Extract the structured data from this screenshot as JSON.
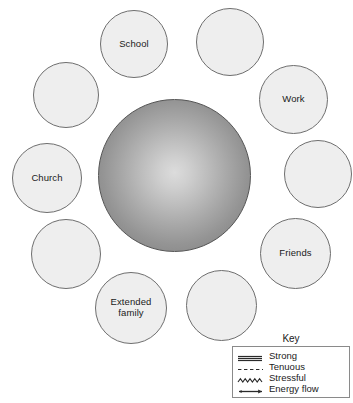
{
  "diagram": {
    "type": "ecomap",
    "center": {
      "name": "central-sphere",
      "label": "",
      "fill_center": "#dcdcdc",
      "fill_edge": "#7e7e7e",
      "border": "#555555"
    },
    "node_fill": "#eeeeee",
    "node_border": "#6e6e6e",
    "nodes": [
      {
        "id": "school",
        "label": "School",
        "x": 100,
        "y": 10,
        "size": 68
      },
      {
        "id": "top-right-blank",
        "label": "",
        "x": 196,
        "y": 8,
        "size": 68
      },
      {
        "id": "upper-left-blank",
        "label": "",
        "x": 33,
        "y": 62,
        "size": 66
      },
      {
        "id": "work",
        "label": "Work",
        "x": 259,
        "y": 65,
        "size": 69
      },
      {
        "id": "church",
        "label": "Church",
        "x": 12,
        "y": 143,
        "size": 70
      },
      {
        "id": "right-blank",
        "label": "",
        "x": 284,
        "y": 140,
        "size": 68
      },
      {
        "id": "lower-left-blank",
        "label": "",
        "x": 31,
        "y": 219,
        "size": 70
      },
      {
        "id": "friends",
        "label": "Friends",
        "x": 260,
        "y": 218,
        "size": 71
      },
      {
        "id": "extended-family",
        "label": "Extended\nfamily",
        "x": 95,
        "y": 272,
        "size": 72
      },
      {
        "id": "bottom-blank",
        "label": "",
        "x": 186,
        "y": 270,
        "size": 71
      }
    ]
  },
  "key": {
    "title": "Key",
    "entries": [
      {
        "id": "strong",
        "label": "Strong",
        "symbol": "triple-line-icon"
      },
      {
        "id": "tenuous",
        "label": "Tenuous",
        "symbol": "dashed-line-icon"
      },
      {
        "id": "stressful",
        "label": "Stressful",
        "symbol": "zigzag-line-icon"
      },
      {
        "id": "energy-flow",
        "label": "Energy flow",
        "symbol": "arrow-line-icon"
      }
    ]
  }
}
